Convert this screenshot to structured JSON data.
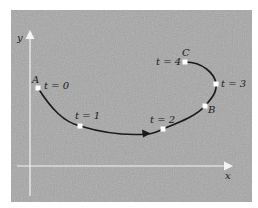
{
  "diagram": {
    "type": "parametric-curve",
    "axes": {
      "x_label": "x",
      "y_label": "y"
    },
    "points": [
      {
        "id": "A",
        "point_label": "A",
        "param_label": "t = 0"
      },
      {
        "id": "p1",
        "point_label": "",
        "param_label": "t = 1"
      },
      {
        "id": "p2",
        "point_label": "",
        "param_label": "t = 2"
      },
      {
        "id": "B",
        "point_label": "B",
        "param_label": ""
      },
      {
        "id": "p3",
        "point_label": "",
        "param_label": "t = 3"
      },
      {
        "id": "C",
        "point_label": "C",
        "param_label": "t = 4"
      }
    ],
    "direction": "arrow along curve from A toward C"
  },
  "colors": {
    "panel": "#a8a8a8",
    "border": "#ffffff",
    "axis": "#ffffff",
    "curve": "#1a1a1a",
    "marker": "#ffffff"
  }
}
